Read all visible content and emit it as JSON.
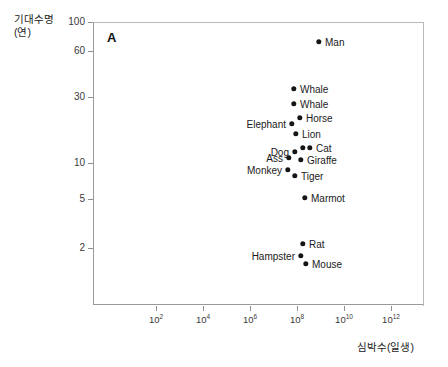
{
  "chart_data": {
    "type": "scatter",
    "title": "",
    "panel_label": "A",
    "xlabel": "심박수(일생)",
    "ylabel": "기대수명\n(연)",
    "ylabel_main": "기대수명",
    "ylabel_unit": "(연)",
    "xscale": "log",
    "yscale": "log",
    "grid": false,
    "legend": "none",
    "xlim": [
      10,
      1000000000000000
    ],
    "ylim": [
      1.2,
      100
    ],
    "xticks": [
      {
        "label": "10",
        "exp": "2",
        "value": 100
      },
      {
        "label": "10",
        "exp": "4",
        "value": 10000
      },
      {
        "label": "10",
        "exp": "6",
        "value": 1000000
      },
      {
        "label": "10",
        "exp": "8",
        "value": 100000000
      },
      {
        "label": "10",
        "exp": "10",
        "value": 10000000000
      },
      {
        "label": "10",
        "exp": "12",
        "value": 1000000000000
      }
    ],
    "yticks": [
      {
        "label": "100",
        "value": 100
      },
      {
        "label": "60",
        "value": 60
      },
      {
        "label": "30",
        "value": 30
      },
      {
        "label": "10",
        "value": 10
      },
      {
        "label": "5",
        "value": 5
      },
      {
        "label": "2",
        "value": 2
      }
    ],
    "points": [
      {
        "name": "Man",
        "label": "Man",
        "side": "right",
        "x": 319,
        "y": 42,
        "heartbeats": 2600000000.0,
        "lifespan": 80
      },
      {
        "name": "Whale1",
        "label": "Whale",
        "side": "right",
        "x": 294,
        "y": 89,
        "heartbeats": 700000000.0,
        "lifespan": 40
      },
      {
        "name": "Whale2",
        "label": "Whale",
        "side": "right",
        "x": 294,
        "y": 104,
        "heartbeats": 700000000.0,
        "lifespan": 32
      },
      {
        "name": "Horse",
        "label": "Horse",
        "side": "right",
        "x": 300,
        "y": 118,
        "heartbeats": 900000000.0,
        "lifespan": 26
      },
      {
        "name": "Elephant",
        "label": "Elephant",
        "side": "left",
        "x": 292,
        "y": 124,
        "heartbeats": 700000000.0,
        "lifespan": 24
      },
      {
        "name": "Lion",
        "label": "Lion",
        "side": "right",
        "x": 296,
        "y": 134,
        "heartbeats": 800000000.0,
        "lifespan": 21
      },
      {
        "name": "Cat1",
        "label": "",
        "side": "right",
        "x": 303,
        "y": 148,
        "heartbeats": 950000000.0,
        "lifespan": 17
      },
      {
        "name": "Cat2",
        "label": "Cat",
        "side": "right",
        "x": 310,
        "y": 148,
        "heartbeats": 1200000000.0,
        "lifespan": 17
      },
      {
        "name": "Dog",
        "label": "Dog",
        "side": "left",
        "x": 295,
        "y": 152,
        "heartbeats": 800000000.0,
        "lifespan": 16
      },
      {
        "name": "Ass",
        "label": "Ass",
        "side": "left",
        "x": 289,
        "y": 158,
        "heartbeats": 650000000.0,
        "lifespan": 15
      },
      {
        "name": "Giraffe",
        "label": "Giraffe",
        "side": "right",
        "x": 301,
        "y": 160,
        "heartbeats": 900000000.0,
        "lifespan": 14
      },
      {
        "name": "Monkey",
        "label": "Monkey",
        "side": "left",
        "x": 288,
        "y": 170,
        "heartbeats": 600000000.0,
        "lifespan": 12
      },
      {
        "name": "Tiger",
        "label": "Tiger",
        "side": "right",
        "x": 295,
        "y": 176,
        "heartbeats": 800000000.0,
        "lifespan": 11
      },
      {
        "name": "Marmot",
        "label": "Marmot",
        "side": "right",
        "x": 305,
        "y": 198,
        "heartbeats": 1000000000.0,
        "lifespan": 6.5
      },
      {
        "name": "Rat",
        "label": "Rat",
        "side": "right",
        "x": 303,
        "y": 244,
        "heartbeats": 950000000.0,
        "lifespan": 2.4
      },
      {
        "name": "Hampster",
        "label": "Hampster",
        "side": "left",
        "x": 301,
        "y": 256,
        "heartbeats": 900000000.0,
        "lifespan": 2.0
      },
      {
        "name": "Mouse",
        "label": "Mouse",
        "side": "right",
        "x": 306,
        "y": 264,
        "heartbeats": 1000000000.0,
        "lifespan": 1.7
      }
    ]
  },
  "geometry": {
    "plot_left": 93,
    "plot_top": 22,
    "plot_right": 424,
    "plot_bottom": 305,
    "ytick_px": {
      "100": 22,
      "60": 51,
      "30": 97,
      "10": 163,
      "5": 199,
      "2": 248
    },
    "xtick_px": {
      "2": 156,
      "4": 203,
      "6": 250,
      "8": 297,
      "10": 344,
      "12": 391
    }
  }
}
